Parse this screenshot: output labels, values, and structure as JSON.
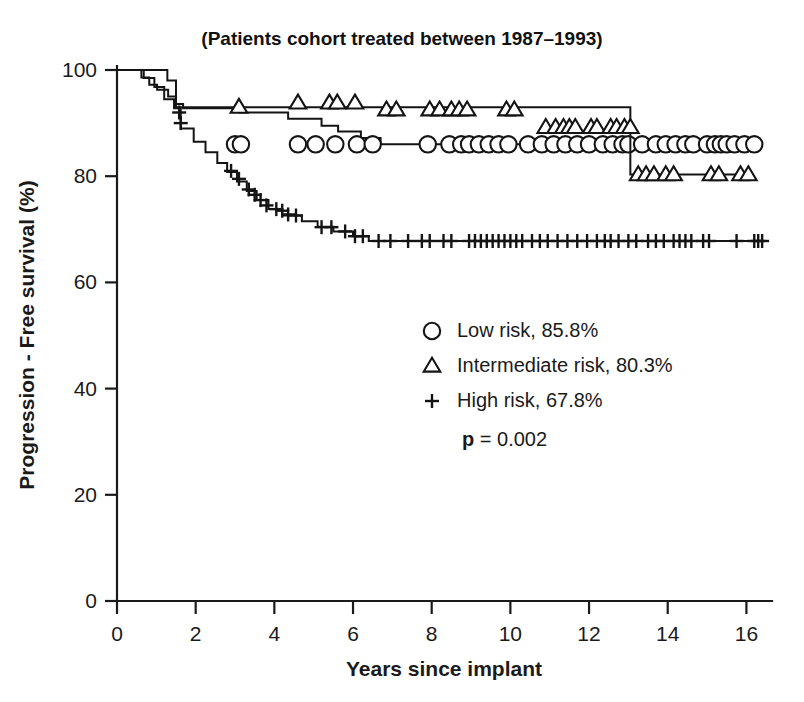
{
  "chart_data": {
    "type": "line",
    "title": "(Patients cohort treated between 1987–1993)",
    "xlabel": "Years since implant",
    "ylabel": "Progression - Free survival (%)",
    "xlim": [
      0,
      16.6
    ],
    "ylim": [
      0,
      100
    ],
    "xticks": [
      "0",
      "2",
      "4",
      "6",
      "8",
      "10",
      "12",
      "14",
      "16"
    ],
    "xtick_values": [
      0,
      2,
      4,
      6,
      8,
      10,
      12,
      14,
      16
    ],
    "yticks": [
      "0",
      "20",
      "40",
      "60",
      "80",
      "100"
    ],
    "ytick_values": [
      0,
      20,
      40,
      60,
      80,
      100
    ],
    "grid": false,
    "legend_position": "center-right",
    "annotation": {
      "p_symbol": "p",
      "p_rest": " = 0.002"
    },
    "series": [
      {
        "name": "Low risk",
        "label": "Low risk, 85.8%",
        "marker": "circle",
        "final_value": 85.8,
        "step_points": [
          [
            0.0,
            100.0
          ],
          [
            0.55,
            100.0
          ],
          [
            0.62,
            98.6
          ],
          [
            0.75,
            98.6
          ],
          [
            0.82,
            97.2
          ],
          [
            0.95,
            97.2
          ],
          [
            1.02,
            96.3
          ],
          [
            1.25,
            96.3
          ],
          [
            1.3,
            95.0
          ],
          [
            1.45,
            95.0
          ],
          [
            1.5,
            93.6
          ],
          [
            1.62,
            93.6
          ],
          [
            1.68,
            92.8
          ],
          [
            2.0,
            92.8
          ],
          [
            3.05,
            92.8
          ],
          [
            3.12,
            92.0
          ],
          [
            4.25,
            92.0
          ],
          [
            4.35,
            90.8
          ],
          [
            5.1,
            90.8
          ],
          [
            5.2,
            89.5
          ],
          [
            5.55,
            89.5
          ],
          [
            5.62,
            88.4
          ],
          [
            6.1,
            88.4
          ],
          [
            6.2,
            87.2
          ],
          [
            6.6,
            87.2
          ],
          [
            6.7,
            86.0
          ],
          [
            16.4,
            86.0
          ]
        ],
        "censor_x": [
          3.0,
          3.15,
          4.6,
          5.05,
          5.55,
          6.1,
          6.5,
          7.9,
          8.45,
          8.75,
          8.95,
          9.2,
          9.45,
          9.7,
          9.95,
          10.45,
          10.8,
          11.1,
          11.4,
          11.7,
          12.0,
          12.35,
          12.6,
          12.85,
          13.0,
          13.35,
          13.7,
          13.95,
          14.2,
          14.45,
          14.65,
          15.0,
          15.2,
          15.35,
          15.5,
          15.7,
          15.95,
          16.2
        ],
        "censor_y": 86.0
      },
      {
        "name": "Intermediate risk",
        "label": "Intermediate risk, 80.3%",
        "marker": "triangle",
        "final_value": 80.3,
        "step_points": [
          [
            0.0,
            100.0
          ],
          [
            1.15,
            100.0
          ],
          [
            1.28,
            98.0
          ],
          [
            1.45,
            98.0
          ],
          [
            1.5,
            93.0
          ],
          [
            3.1,
            93.0
          ],
          [
            12.95,
            93.0
          ],
          [
            13.05,
            80.3
          ],
          [
            16.1,
            80.3
          ]
        ],
        "censor_marks": [
          {
            "x": 3.1,
            "y": 93.0
          },
          {
            "x": 4.6,
            "y": 93.8
          },
          {
            "x": 5.4,
            "y": 93.8
          },
          {
            "x": 5.6,
            "y": 93.8
          },
          {
            "x": 6.05,
            "y": 93.8
          },
          {
            "x": 6.85,
            "y": 92.5
          },
          {
            "x": 7.1,
            "y": 92.5
          },
          {
            "x": 7.95,
            "y": 92.5
          },
          {
            "x": 8.2,
            "y": 92.5
          },
          {
            "x": 8.5,
            "y": 92.5
          },
          {
            "x": 8.7,
            "y": 92.5
          },
          {
            "x": 8.9,
            "y": 92.5
          },
          {
            "x": 9.9,
            "y": 92.5
          },
          {
            "x": 10.1,
            "y": 92.5
          },
          {
            "x": 10.9,
            "y": 89.2
          },
          {
            "x": 11.15,
            "y": 89.2
          },
          {
            "x": 11.35,
            "y": 89.2
          },
          {
            "x": 11.5,
            "y": 89.2
          },
          {
            "x": 11.65,
            "y": 89.2
          },
          {
            "x": 12.05,
            "y": 89.2
          },
          {
            "x": 12.2,
            "y": 89.2
          },
          {
            "x": 12.55,
            "y": 89.2
          },
          {
            "x": 12.7,
            "y": 89.2
          },
          {
            "x": 12.9,
            "y": 89.2
          },
          {
            "x": 13.05,
            "y": 89.2
          },
          {
            "x": 13.25,
            "y": 80.3
          },
          {
            "x": 13.45,
            "y": 80.3
          },
          {
            "x": 13.65,
            "y": 80.3
          },
          {
            "x": 13.95,
            "y": 80.3
          },
          {
            "x": 14.15,
            "y": 80.3
          },
          {
            "x": 15.1,
            "y": 80.3
          },
          {
            "x": 15.3,
            "y": 80.3
          },
          {
            "x": 15.85,
            "y": 80.3
          },
          {
            "x": 16.05,
            "y": 80.3
          }
        ]
      },
      {
        "name": "High risk",
        "label": "High risk, 67.8%",
        "marker": "plus",
        "final_value": 67.8,
        "step_points": [
          [
            0.0,
            100.0
          ],
          [
            0.6,
            100.0
          ],
          [
            0.68,
            98.5
          ],
          [
            0.85,
            98.5
          ],
          [
            0.95,
            96.8
          ],
          [
            1.1,
            96.8
          ],
          [
            1.2,
            94.5
          ],
          [
            1.35,
            94.5
          ],
          [
            1.45,
            92.8
          ],
          [
            1.55,
            92.8
          ],
          [
            1.62,
            89.0
          ],
          [
            1.85,
            89.0
          ],
          [
            1.95,
            86.5
          ],
          [
            2.15,
            86.5
          ],
          [
            2.25,
            84.5
          ],
          [
            2.45,
            84.5
          ],
          [
            2.55,
            82.5
          ],
          [
            2.7,
            82.5
          ],
          [
            2.8,
            80.8
          ],
          [
            2.95,
            80.8
          ],
          [
            3.05,
            79.0
          ],
          [
            3.2,
            79.0
          ],
          [
            3.3,
            77.2
          ],
          [
            3.45,
            77.2
          ],
          [
            3.55,
            75.5
          ],
          [
            3.75,
            75.5
          ],
          [
            3.85,
            73.8
          ],
          [
            4.1,
            73.8
          ],
          [
            4.2,
            72.6
          ],
          [
            4.6,
            72.6
          ],
          [
            4.7,
            71.5
          ],
          [
            5.0,
            71.5
          ],
          [
            5.1,
            70.5
          ],
          [
            5.4,
            70.5
          ],
          [
            5.5,
            69.6
          ],
          [
            5.9,
            69.6
          ],
          [
            6.0,
            68.7
          ],
          [
            6.3,
            68.7
          ],
          [
            6.4,
            67.8
          ],
          [
            16.45,
            67.8
          ]
        ],
        "censor_marks": [
          {
            "x": 1.58,
            "y": 92.0
          },
          {
            "x": 1.62,
            "y": 90.0
          },
          {
            "x": 2.9,
            "y": 81.0
          },
          {
            "x": 3.1,
            "y": 79.5
          },
          {
            "x": 3.35,
            "y": 77.5
          },
          {
            "x": 3.5,
            "y": 76.5
          },
          {
            "x": 3.65,
            "y": 75.5
          },
          {
            "x": 3.8,
            "y": 74.5
          },
          {
            "x": 4.05,
            "y": 73.8
          },
          {
            "x": 4.2,
            "y": 73.5
          },
          {
            "x": 4.35,
            "y": 72.8
          },
          {
            "x": 4.55,
            "y": 72.6
          },
          {
            "x": 5.2,
            "y": 70.4
          },
          {
            "x": 5.45,
            "y": 70.4
          },
          {
            "x": 5.8,
            "y": 69.6
          },
          {
            "x": 6.05,
            "y": 68.7
          },
          {
            "x": 6.25,
            "y": 68.7
          },
          {
            "x": 6.65,
            "y": 67.8
          },
          {
            "x": 6.95,
            "y": 67.8
          },
          {
            "x": 7.4,
            "y": 67.8
          },
          {
            "x": 7.75,
            "y": 67.8
          },
          {
            "x": 7.95,
            "y": 67.8
          },
          {
            "x": 8.3,
            "y": 67.8
          },
          {
            "x": 8.5,
            "y": 67.8
          },
          {
            "x": 8.95,
            "y": 67.8
          },
          {
            "x": 9.1,
            "y": 67.8
          },
          {
            "x": 9.25,
            "y": 67.8
          },
          {
            "x": 9.4,
            "y": 67.8
          },
          {
            "x": 9.55,
            "y": 67.8
          },
          {
            "x": 9.7,
            "y": 67.8
          },
          {
            "x": 9.85,
            "y": 67.8
          },
          {
            "x": 10.0,
            "y": 67.8
          },
          {
            "x": 10.15,
            "y": 67.8
          },
          {
            "x": 10.3,
            "y": 67.8
          },
          {
            "x": 10.55,
            "y": 67.8
          },
          {
            "x": 10.75,
            "y": 67.8
          },
          {
            "x": 10.95,
            "y": 67.8
          },
          {
            "x": 11.2,
            "y": 67.8
          },
          {
            "x": 11.45,
            "y": 67.8
          },
          {
            "x": 11.7,
            "y": 67.8
          },
          {
            "x": 11.95,
            "y": 67.8
          },
          {
            "x": 12.2,
            "y": 67.8
          },
          {
            "x": 12.4,
            "y": 67.8
          },
          {
            "x": 12.55,
            "y": 67.8
          },
          {
            "x": 12.75,
            "y": 67.8
          },
          {
            "x": 13.0,
            "y": 67.8
          },
          {
            "x": 13.2,
            "y": 67.8
          },
          {
            "x": 13.5,
            "y": 67.8
          },
          {
            "x": 13.7,
            "y": 67.8
          },
          {
            "x": 13.9,
            "y": 67.8
          },
          {
            "x": 14.15,
            "y": 67.8
          },
          {
            "x": 14.3,
            "y": 67.8
          },
          {
            "x": 14.45,
            "y": 67.8
          },
          {
            "x": 14.6,
            "y": 67.8
          },
          {
            "x": 14.9,
            "y": 67.8
          },
          {
            "x": 15.05,
            "y": 67.8
          },
          {
            "x": 15.75,
            "y": 67.8
          },
          {
            "x": 16.2,
            "y": 67.8
          },
          {
            "x": 16.3,
            "y": 67.8
          },
          {
            "x": 16.4,
            "y": 67.8
          }
        ]
      }
    ]
  },
  "legend": {
    "items": [
      {
        "marker": "circle",
        "label": "Low risk, 85.8%"
      },
      {
        "marker": "triangle",
        "label": "Intermediate risk, 80.3%"
      },
      {
        "marker": "plus",
        "label": "High risk, 67.8%"
      }
    ]
  },
  "colors": {
    "ink": "#141414",
    "background": "#ffffff"
  }
}
